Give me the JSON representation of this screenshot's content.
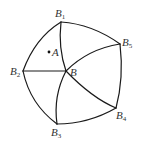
{
  "diagram": {
    "type": "geometric-figure",
    "colors": {
      "stroke": "#1a1a1a",
      "text": "#333333",
      "background": "#ffffff"
    },
    "labels": {
      "B1": {
        "main": "B",
        "sub": "1"
      },
      "B2": {
        "main": "B",
        "sub": "2"
      },
      "B3": {
        "main": "B",
        "sub": "3"
      },
      "B4": {
        "main": "B",
        "sub": "4"
      },
      "B5": {
        "main": "B",
        "sub": "5"
      },
      "B": {
        "main": "B"
      },
      "A": {
        "main": "A"
      }
    },
    "nodes": [
      {
        "id": "B1",
        "x": 61,
        "y": 22
      },
      {
        "id": "B5",
        "x": 120,
        "y": 44
      },
      {
        "id": "B4",
        "x": 116,
        "y": 108
      },
      {
        "id": "B3",
        "x": 57,
        "y": 124
      },
      {
        "id": "B2",
        "x": 23,
        "y": 71
      },
      {
        "id": "B",
        "x": 66,
        "y": 71
      },
      {
        "id": "A",
        "x": 49,
        "y": 52
      }
    ],
    "edges": [
      {
        "from": "B1",
        "to": "B5",
        "kind": "arc"
      },
      {
        "from": "B5",
        "to": "B4",
        "kind": "arc"
      },
      {
        "from": "B4",
        "to": "B3",
        "kind": "arc"
      },
      {
        "from": "B3",
        "to": "B2",
        "kind": "arc"
      },
      {
        "from": "B2",
        "to": "B1",
        "kind": "arc"
      },
      {
        "from": "B",
        "to": "B1",
        "kind": "arc"
      },
      {
        "from": "B",
        "to": "B2",
        "kind": "line"
      },
      {
        "from": "B",
        "to": "B3",
        "kind": "arc"
      },
      {
        "from": "B",
        "to": "B4",
        "kind": "arc"
      },
      {
        "from": "B",
        "to": "B5",
        "kind": "arc"
      }
    ]
  }
}
